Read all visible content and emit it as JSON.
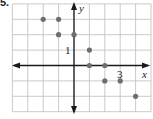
{
  "problem_label": "5.",
  "chart_data": {
    "type": "scatter",
    "title": "",
    "xlabel": "x",
    "ylabel": "y",
    "tick_labels": {
      "x": [
        "3"
      ],
      "y": [
        "1"
      ]
    },
    "xlim": [
      -4,
      5
    ],
    "ylim": [
      -3,
      4
    ],
    "grid": true,
    "points": [
      {
        "x": -2,
        "y": 3
      },
      {
        "x": -1,
        "y": 3
      },
      {
        "x": -1,
        "y": 2
      },
      {
        "x": 0,
        "y": 2
      },
      {
        "x": 1,
        "y": 1
      },
      {
        "x": 1,
        "y": 0
      },
      {
        "x": 2,
        "y": 0
      },
      {
        "x": 2,
        "y": -1
      },
      {
        "x": 3,
        "y": -1
      },
      {
        "x": 4,
        "y": -2
      }
    ],
    "colors": {
      "grid": "#bdbdbd",
      "axis": "#1a1a1a",
      "point": "#6e6e6e"
    }
  }
}
